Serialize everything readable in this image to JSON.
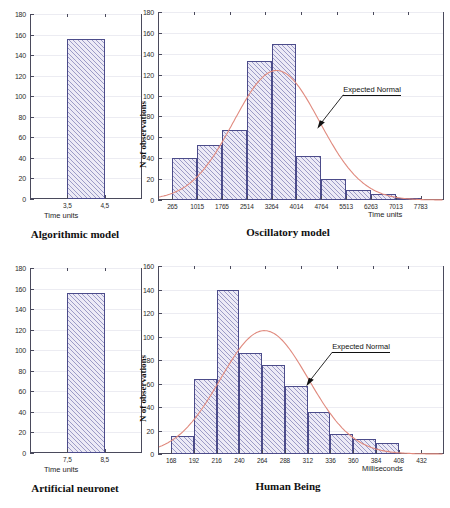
{
  "figure": {
    "background": "#ffffff",
    "bar_fill": "#eceaf6",
    "bar_edge": "#4c4c8a",
    "curve_color": "#e08a7e",
    "grid_color": "#ececf2",
    "axis_color": "#4a4a5c"
  },
  "chart_data": [
    {
      "id": "algorithmic-model",
      "type": "bar",
      "title": "Algorithmic model",
      "xlabel": "Time units",
      "ylabel": "",
      "categories": [
        "3,5",
        "4,5"
      ],
      "values": [
        156
      ],
      "bar_span": [
        "3,5",
        "4,5"
      ],
      "ylim": [
        0,
        180
      ],
      "yticks": [
        0,
        20,
        40,
        60,
        80,
        100,
        120,
        140,
        160,
        180
      ],
      "grid": true,
      "legend": "none",
      "curve": false
    },
    {
      "id": "oscillatory-model",
      "type": "bar",
      "title": "Oscillatory model",
      "xlabel": "Time units",
      "ylabel": "N of observations",
      "categories": [
        "265",
        "1015",
        "1765",
        "2514",
        "3264",
        "4014",
        "4764",
        "5513",
        "6263",
        "7013",
        "7783"
      ],
      "values": [
        40,
        53,
        67,
        133,
        149,
        42,
        20,
        10,
        6,
        2
      ],
      "ylim": [
        0,
        180
      ],
      "yticks": [
        0,
        20,
        40,
        60,
        80,
        100,
        120,
        140,
        160,
        180
      ],
      "grid": true,
      "curve": true,
      "curve_label": "Expected Normal",
      "curve_peak": 124,
      "curve_peak_index": 4.2,
      "curve_sigma_bins": 1.65,
      "legend": "annotation-arrow"
    },
    {
      "id": "artificial-neuronet",
      "type": "bar",
      "title": "Artificial neuronet",
      "xlabel": "Time units",
      "ylabel": "",
      "categories": [
        "7,5",
        "8,5"
      ],
      "values": [
        156
      ],
      "bar_span": [
        "7,5",
        "8,5"
      ],
      "ylim": [
        0,
        180
      ],
      "yticks": [
        0,
        20,
        40,
        60,
        80,
        100,
        120,
        140,
        160,
        180
      ],
      "grid": true,
      "legend": "none",
      "curve": false
    },
    {
      "id": "human-being",
      "type": "bar",
      "title": "Human Being",
      "xlabel": "Milliseconds",
      "ylabel": "N of observations",
      "categories": [
        "168",
        "192",
        "216",
        "240",
        "264",
        "288",
        "312",
        "336",
        "360",
        "384",
        "408",
        "432"
      ],
      "values": [
        15,
        64,
        140,
        86,
        76,
        58,
        36,
        17,
        13,
        9
      ],
      "ylim": [
        0,
        160
      ],
      "yticks": [
        0,
        20,
        40,
        60,
        80,
        100,
        120,
        140,
        160
      ],
      "grid": true,
      "curve": true,
      "curve_label": "Expected Normal",
      "curve_peak": 105,
      "curve_peak_index": 4.1,
      "curve_sigma_bins": 1.85,
      "legend": "annotation-arrow"
    }
  ]
}
